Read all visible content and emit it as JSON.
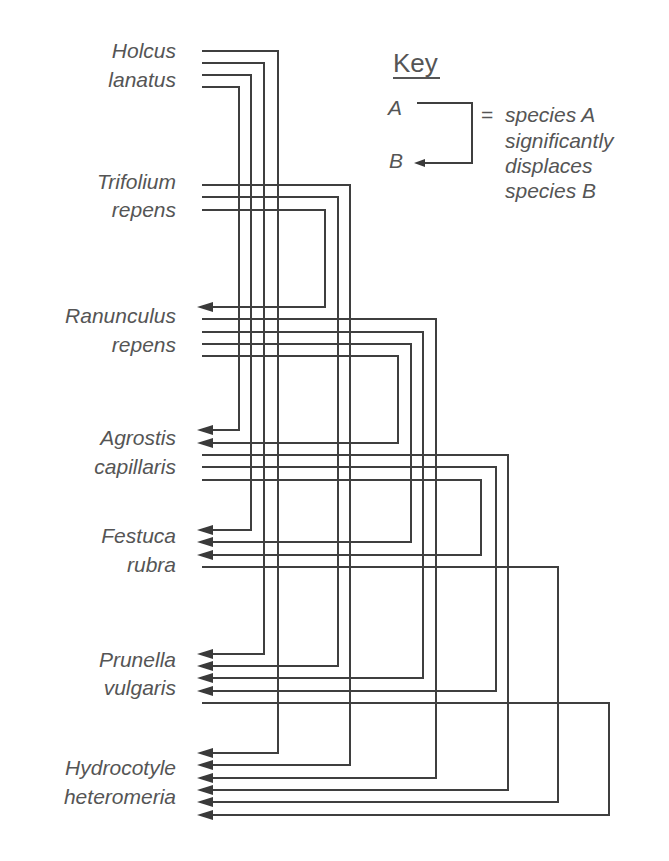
{
  "diagram": {
    "type": "species-displacement-network",
    "species": [
      {
        "id": "holcus",
        "line1": "Holcus",
        "line2": "lanatus",
        "baseline1": 58,
        "baseline2": 87
      },
      {
        "id": "trifolium",
        "line1": "Trifolium",
        "line2": "repens",
        "baseline1": 189,
        "baseline2": 217
      },
      {
        "id": "ranunculus",
        "line1": "Ranunculus",
        "line2": "repens",
        "baseline1": 323,
        "baseline2": 352
      },
      {
        "id": "agrostis",
        "line1": "Agrostis",
        "line2": "capillaris",
        "baseline1": 445,
        "baseline2": 474
      },
      {
        "id": "festuca",
        "line1": "Festuca",
        "line2": "rubra",
        "baseline1": 543,
        "baseline2": 572
      },
      {
        "id": "prunella",
        "line1": "Prunella",
        "line2": "vulgaris",
        "baseline1": 667,
        "baseline2": 695
      },
      {
        "id": "hydrocotyle",
        "line1": "Hydrocotyle",
        "line2": "heteromeria",
        "baseline1": 775,
        "baseline2": 804
      }
    ],
    "edges": [
      {
        "from": "Holcus lanatus",
        "to": "Hydrocotyle heteromeria",
        "y_start": 51,
        "x_turn": 278,
        "y_end": 753
      },
      {
        "from": "Holcus lanatus",
        "to": "Prunella vulgaris",
        "y_start": 63,
        "x_turn": 264,
        "y_end": 654
      },
      {
        "from": "Holcus lanatus",
        "to": "Festuca rubra",
        "y_start": 75,
        "x_turn": 251,
        "y_end": 530
      },
      {
        "from": "Holcus lanatus",
        "to": "Agrostis capillaris",
        "y_start": 87,
        "x_turn": 239,
        "y_end": 430
      },
      {
        "from": "Trifolium repens",
        "to": "Hydrocotyle heteromeria",
        "y_start": 185,
        "x_turn": 350,
        "y_end": 765
      },
      {
        "from": "Trifolium repens",
        "to": "Prunella vulgaris",
        "y_start": 197,
        "x_turn": 338,
        "y_end": 666
      },
      {
        "from": "Trifolium repens",
        "to": "Ranunculus repens",
        "y_start": 210,
        "x_turn": 325,
        "y_end": 307
      },
      {
        "from": "Ranunculus repens",
        "to": "Hydrocotyle heteromeria",
        "y_start": 319,
        "x_turn": 436,
        "y_end": 778
      },
      {
        "from": "Ranunculus repens",
        "to": "Prunella vulgaris",
        "y_start": 332,
        "x_turn": 423,
        "y_end": 678
      },
      {
        "from": "Ranunculus repens",
        "to": "Festuca rubra",
        "y_start": 344,
        "x_turn": 411,
        "y_end": 542
      },
      {
        "from": "Ranunculus repens",
        "to": "Agrostis capillaris",
        "y_start": 356,
        "x_turn": 398,
        "y_end": 443
      },
      {
        "from": "Agrostis capillaris",
        "to": "Hydrocotyle heteromeria",
        "y_start": 455,
        "x_turn": 508,
        "y_end": 790
      },
      {
        "from": "Agrostis capillaris",
        "to": "Prunella vulgaris",
        "y_start": 467,
        "x_turn": 496,
        "y_end": 691
      },
      {
        "from": "Agrostis capillaris",
        "to": "Festuca rubra",
        "y_start": 480,
        "x_turn": 481,
        "y_end": 555
      },
      {
        "from": "Festuca rubra",
        "to": "Hydrocotyle heteromeria",
        "y_start": 567,
        "x_turn": 558,
        "y_end": 802
      },
      {
        "from": "Prunella vulgaris",
        "to": "Hydrocotyle heteromeria",
        "y_start": 703,
        "x_turn": 609,
        "y_end": 815
      }
    ],
    "line_start_x": 202,
    "arrow_tip_x": 197
  },
  "key": {
    "title": "Key",
    "label_a": "A",
    "label_b": "B",
    "equals": "=",
    "description_lines": [
      "species A",
      "significantly",
      "displaces",
      "species B"
    ]
  },
  "colors": {
    "line": "#3f3f3f",
    "text": "#555555",
    "background": "#ffffff"
  }
}
